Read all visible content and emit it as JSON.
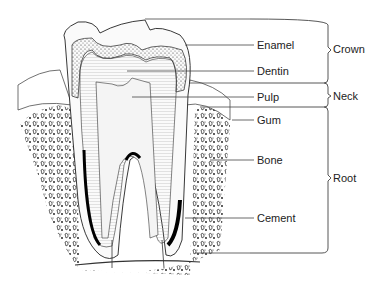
{
  "diagram": {
    "parts": [
      {
        "label": "Enamel",
        "y": 45
      },
      {
        "label": "Dentin",
        "y": 71
      },
      {
        "label": "Pulp",
        "y": 97
      },
      {
        "label": "Gum",
        "y": 120
      },
      {
        "label": "Bone",
        "y": 160
      },
      {
        "label": "Cement",
        "y": 218
      }
    ],
    "regions": [
      {
        "label": "Crown",
        "top": 19,
        "bottom": 83
      },
      {
        "label": "Neck",
        "top": 83,
        "bottom": 107
      },
      {
        "label": "Root",
        "top": 107,
        "bottom": 253
      }
    ]
  }
}
